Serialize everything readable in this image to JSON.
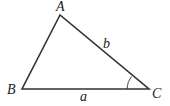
{
  "diagram": {
    "type": "triangle",
    "vertices": [
      {
        "label": "A",
        "x": 60,
        "y": 15
      },
      {
        "label": "B",
        "x": 22,
        "y": 89
      },
      {
        "label": "C",
        "x": 149,
        "y": 89
      }
    ],
    "sides": [
      {
        "label": "a",
        "between": [
          "B",
          "C"
        ]
      },
      {
        "label": "b",
        "between": [
          "A",
          "C"
        ]
      }
    ],
    "marked_angle": "C",
    "colors": {
      "stroke": "#333333",
      "text": "#222222",
      "background": "#ffffff"
    }
  }
}
